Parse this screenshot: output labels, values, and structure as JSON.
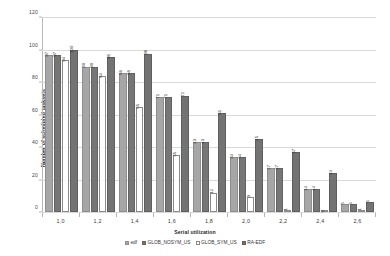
{
  "chart_data": {
    "type": "bar",
    "title": "",
    "xlabel": "Serial utilization",
    "ylabel": "Number of scheduled tasksets",
    "categories": [
      "1,0",
      "1,2",
      "1,4",
      "1,6",
      "1,8",
      "2,0",
      "2,2",
      "2,4",
      "2,6"
    ],
    "ylim": [
      0,
      120
    ],
    "yticks": [
      0,
      20,
      40,
      60,
      80,
      100,
      120
    ],
    "ytick_labels": [
      "0",
      "20",
      "40",
      "60",
      "80",
      "100",
      "120"
    ],
    "grid": true,
    "legend_position": "bottom",
    "series": [
      {
        "name": "edf",
        "color": "#a6a6a6",
        "values": [
          97,
          90,
          86,
          71,
          43,
          34,
          27,
          14,
          5
        ],
        "labels": [
          "97",
          "90",
          "86",
          "71",
          "43",
          "34",
          "27",
          "14",
          "5"
        ]
      },
      {
        "name": "GLOB_NOSYM_US",
        "color": "#767676",
        "values": [
          97,
          90,
          86,
          71,
          43,
          34,
          27,
          14,
          5
        ],
        "labels": [
          "97",
          "90",
          "86",
          "71",
          "43",
          "34",
          "27",
          "14",
          "5"
        ]
      },
      {
        "name": "GLOB_SYM_US",
        "color": "#ffffff",
        "values": [
          94,
          84,
          65,
          35,
          12,
          9,
          1,
          0,
          1
        ],
        "labels": [
          "94",
          "84",
          "65",
          "35",
          "12",
          "9",
          "1",
          "0",
          "1"
        ]
      },
      {
        "name": "RA-EDF",
        "color": "#737373",
        "values": [
          100,
          96,
          98,
          72,
          61,
          45,
          37,
          24,
          6
        ],
        "labels": [
          "100",
          "96",
          "98",
          "72",
          "61",
          "45",
          "37",
          "24",
          "6"
        ]
      }
    ]
  },
  "axis": {
    "y_title": "Number of scheduled tasksets",
    "x_title": "Serial utilization"
  }
}
